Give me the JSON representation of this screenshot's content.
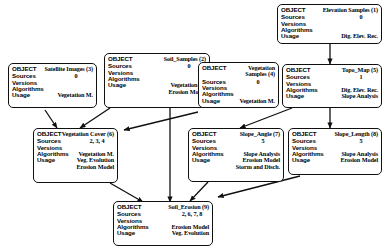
{
  "diagram": {
    "type": "object-dependency-diagram",
    "label_fields": {
      "object": "OBJECT",
      "sources": "Sources",
      "versions": "Versions",
      "algorithms": "Algorithms",
      "usage": "Usage"
    },
    "nodes": [
      {
        "id": "elevation_samples",
        "title": "Elevation Samples (1)",
        "number": 1,
        "sources": "0",
        "versions": "",
        "algorithms": "",
        "usage": [
          "Dig. Elev. Rec."
        ]
      },
      {
        "id": "soil_samples",
        "title": "Soil_Samples (2)",
        "number": 2,
        "sources": "0",
        "versions": "",
        "algorithms": "",
        "usage": [
          "Vegetation M.",
          "Erosion Model"
        ]
      },
      {
        "id": "satellite_images",
        "title": "Satellite Images (3)",
        "number": 3,
        "sources": "0",
        "versions": "",
        "algorithms": "",
        "usage": [
          "Vegetation M."
        ]
      },
      {
        "id": "vegetation_samples",
        "title": "Vegetation Samples (4)",
        "number": 4,
        "sources": "0",
        "versions": "",
        "algorithms": "",
        "usage": [
          "Vegetation M."
        ]
      },
      {
        "id": "topo_map",
        "title": "Topo_Map (5)",
        "number": 5,
        "sources": "1",
        "versions": "",
        "algorithms": "Dig. Elev. Rec.",
        "usage": [
          "Slope Analysis"
        ]
      },
      {
        "id": "vegetation_cover",
        "title": "Vegetation Cover (6)",
        "number": 6,
        "sources": "2, 3, 4",
        "versions": "",
        "algorithms": "Vegetation M.",
        "usage": [
          "Veg. Evolution",
          "Erosion Model"
        ]
      },
      {
        "id": "slope_angle",
        "title": "Slope_Angle (7)",
        "number": 7,
        "sources": "5",
        "versions": "",
        "algorithms": "Slope Analysis",
        "usage": [
          "Erosion Model",
          "Storm and Disch."
        ]
      },
      {
        "id": "slope_length",
        "title": "Slope_Length (8)",
        "number": 8,
        "sources": "5",
        "versions": "",
        "algorithms": "Slope Analysis",
        "usage": [
          "Erosion Model"
        ]
      },
      {
        "id": "soil_erosion",
        "title": "Soil_Erosion (9)",
        "number": 9,
        "sources": "2, 6, 7, 8",
        "versions": "",
        "algorithms": "Erosion Model",
        "usage": [
          "Veg. Evolution"
        ]
      }
    ],
    "edges": [
      {
        "from": "elevation_samples",
        "to": "topo_map"
      },
      {
        "from": "satellite_images",
        "to": "vegetation_cover"
      },
      {
        "from": "soil_samples",
        "to": "vegetation_cover"
      },
      {
        "from": "vegetation_samples",
        "to": "vegetation_cover"
      },
      {
        "from": "topo_map",
        "to": "slope_angle"
      },
      {
        "from": "topo_map",
        "to": "slope_length"
      },
      {
        "from": "vegetation_cover",
        "to": "soil_erosion"
      },
      {
        "from": "soil_samples",
        "to": "soil_erosion"
      },
      {
        "from": "slope_angle",
        "to": "soil_erosion"
      },
      {
        "from": "slope_length",
        "to": "soil_erosion"
      }
    ],
    "colors": {
      "stroke": "#101010",
      "background": "#ffffff",
      "text": "#000000"
    }
  }
}
